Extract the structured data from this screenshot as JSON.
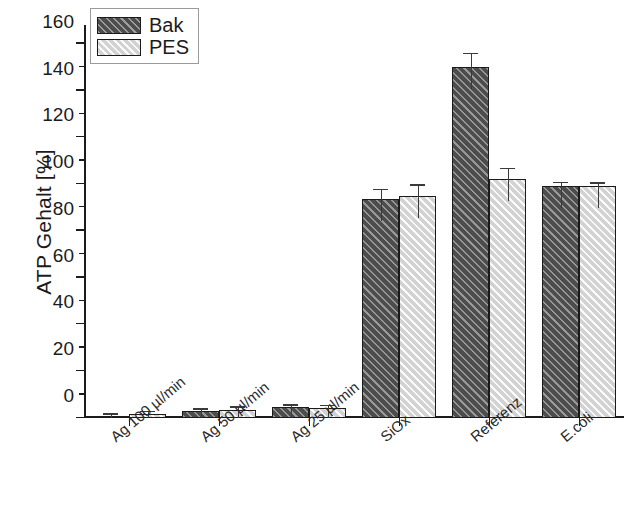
{
  "chart_data": {
    "type": "bar",
    "title": "",
    "xlabel": "",
    "ylabel": "ATP Gehalt [%]",
    "ylim": [
      0,
      168
    ],
    "yticks": [
      0,
      20,
      40,
      60,
      80,
      100,
      120,
      140,
      160
    ],
    "ytick_labels": [
      "0",
      "20",
      "40",
      "60",
      "80",
      "100",
      "120",
      "140",
      "160"
    ],
    "minor_ticks": true,
    "grid": false,
    "legend": {
      "position": "top-left",
      "entries": [
        {
          "name": "Bak",
          "color": "#4d4d4d",
          "hatch": "/"
        },
        {
          "name": "PES",
          "color": "#d2d2d2",
          "hatch": "/"
        }
      ]
    },
    "categories": [
      "Ag 100 µl/min",
      "Ag 50 µl/min",
      "Ag 25 µl/min",
      "SiOx",
      "Referenz",
      "E.coli"
    ],
    "series": [
      {
        "name": "Bak",
        "color": "#4d4d4d",
        "values": [
          1.0,
          2.8,
          4.6,
          93.8,
          150.0,
          99.3
        ],
        "errors": [
          0.5,
          0.8,
          0.6,
          3.5,
          5.5,
          1.2
        ]
      },
      {
        "name": "PES",
        "color": "#d2d2d2",
        "values": [
          1.8,
          3.4,
          4.3,
          94.8,
          102.3,
          99.2
        ],
        "errors": [
          0.8,
          1.0,
          0.8,
          4.5,
          4.0,
          1.0
        ]
      }
    ]
  },
  "axis": {
    "y_title": "ATP Gehalt [%]"
  },
  "legend": {
    "bak_label": "Bak",
    "pes_label": "PES"
  }
}
